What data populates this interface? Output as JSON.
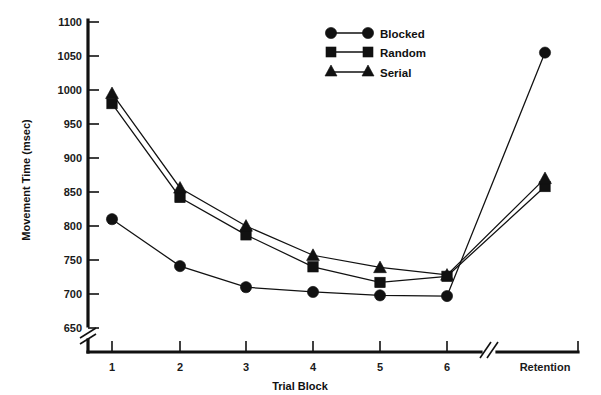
{
  "chart_data": {
    "type": "line",
    "title": "",
    "xlabel": "Trial Block",
    "ylabel": "Movement Time (msec)",
    "categories": [
      "1",
      "2",
      "3",
      "4",
      "5",
      "6",
      "Retention"
    ],
    "x_tick_labels": [
      "1",
      "2",
      "3",
      "4",
      "5",
      "6",
      "Retention"
    ],
    "y_tick_labels": [
      "650",
      "700",
      "750",
      "800",
      "850",
      "900",
      "950",
      "1000",
      "1050",
      "1100"
    ],
    "y_ticks": [
      650,
      700,
      750,
      800,
      850,
      900,
      950,
      1000,
      1050,
      1100
    ],
    "ylim": [
      650,
      1100
    ],
    "y_axis_break": true,
    "x_axis_break": true,
    "x_axis_break_note": "break between block 6 and Retention",
    "grid": false,
    "legend_position": "top-center",
    "series": [
      {
        "name": "Blocked",
        "marker": "circle",
        "color": "#111111",
        "values": [
          810,
          741,
          710,
          703,
          698,
          697,
          1055
        ]
      },
      {
        "name": "Random",
        "marker": "square",
        "color": "#111111",
        "values": [
          980,
          842,
          787,
          740,
          717,
          726,
          858
        ]
      },
      {
        "name": "Serial",
        "marker": "triangle",
        "color": "#111111",
        "values": [
          995,
          856,
          800,
          757,
          739,
          728,
          870
        ]
      }
    ]
  },
  "legend": {
    "items": [
      {
        "label": "Blocked",
        "marker": "circle"
      },
      {
        "label": "Random",
        "marker": "square"
      },
      {
        "label": "Serial",
        "marker": "triangle"
      }
    ]
  },
  "axes": {
    "x_title": "Trial Block",
    "y_title": "Movement Time (msec)"
  },
  "colors": {
    "ink": "#111111",
    "background": "#ffffff"
  }
}
